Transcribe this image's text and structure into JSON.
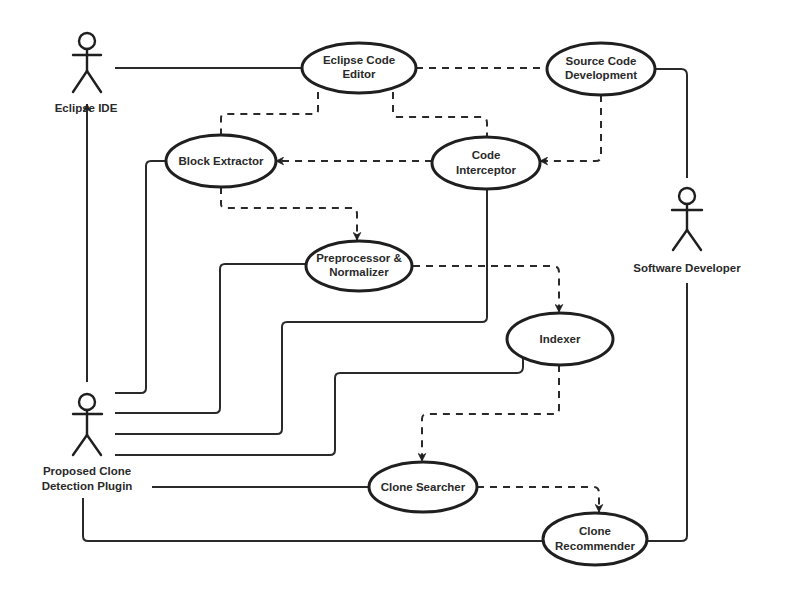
{
  "diagram": {
    "type": "uml-use-case",
    "actors": [
      {
        "id": "eclipse_ide",
        "label": "Eclipse IDE"
      },
      {
        "id": "software_developer",
        "label": "Software Developer"
      },
      {
        "id": "plugin",
        "label_lines": [
          "Proposed Clone",
          "Detection Plugin"
        ]
      }
    ],
    "use_cases": [
      {
        "id": "editor",
        "label_lines": [
          "Eclipse Code",
          "Editor"
        ]
      },
      {
        "id": "source_dev",
        "label_lines": [
          "Source Code",
          "Development"
        ]
      },
      {
        "id": "block_extractor",
        "label_lines": [
          "Block Extractor"
        ]
      },
      {
        "id": "interceptor",
        "label_lines": [
          "Code",
          "Interceptor"
        ]
      },
      {
        "id": "preprocessor",
        "label_lines": [
          "Preprocessor &",
          "Normalizer"
        ]
      },
      {
        "id": "indexer",
        "label_lines": [
          "Indexer"
        ]
      },
      {
        "id": "searcher",
        "label_lines": [
          "Clone Searcher"
        ]
      },
      {
        "id": "recommender",
        "label_lines": [
          "Clone",
          "Recommender"
        ]
      }
    ],
    "associations": [
      {
        "from": "eclipse_ide",
        "to": "editor",
        "style": "solid"
      },
      {
        "from": "source_dev",
        "to": "software_developer",
        "style": "solid"
      },
      {
        "from": "software_developer",
        "to": "recommender",
        "style": "solid"
      },
      {
        "from": "plugin",
        "to": "eclipse_ide",
        "style": "solid-arrow"
      },
      {
        "from": "plugin",
        "to": "block_extractor",
        "style": "solid"
      },
      {
        "from": "plugin",
        "to": "preprocessor",
        "style": "solid"
      },
      {
        "from": "plugin",
        "to": "interceptor",
        "style": "solid"
      },
      {
        "from": "plugin",
        "to": "indexer",
        "style": "solid"
      },
      {
        "from": "plugin",
        "to": "searcher",
        "style": "solid"
      },
      {
        "from": "plugin",
        "to": "recommender",
        "style": "solid"
      }
    ],
    "dependencies": [
      {
        "from": "editor",
        "to": "source_dev",
        "style": "dashed"
      },
      {
        "from": "editor",
        "to": "block_extractor",
        "style": "dashed"
      },
      {
        "from": "editor",
        "to": "interceptor",
        "style": "dashed"
      },
      {
        "from": "source_dev",
        "to": "interceptor",
        "style": "dashed-arrow"
      },
      {
        "from": "interceptor",
        "to": "block_extractor",
        "style": "dashed-arrow"
      },
      {
        "from": "block_extractor",
        "to": "preprocessor",
        "style": "dashed-arrow"
      },
      {
        "from": "preprocessor",
        "to": "indexer",
        "style": "dashed-arrow"
      },
      {
        "from": "indexer",
        "to": "searcher",
        "style": "dashed-arrow"
      },
      {
        "from": "searcher",
        "to": "recommender",
        "style": "dashed-arrow"
      }
    ]
  }
}
